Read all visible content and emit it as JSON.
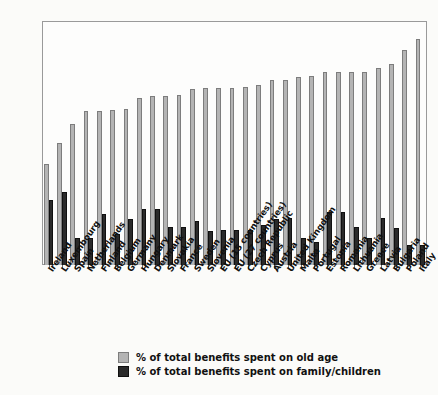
{
  "chart_data": {
    "type": "bar",
    "title": "",
    "subtitle": "",
    "xlabel": "",
    "ylabel": "",
    "ylim": [
      0,
      55
    ],
    "yticks": [
      0,
      5,
      10,
      15,
      20,
      25,
      30,
      35,
      40,
      45,
      50,
      55
    ],
    "grid": false,
    "legend_position": "bottom",
    "categories": [
      "Ireland",
      "Luxembourg",
      "Spain",
      "Netherlands",
      "Finland",
      "Belgium",
      "Germany",
      "Hungary",
      "Denmark",
      "Slovakia",
      "France",
      "Sweden",
      "Slovenia",
      "EU (15 countries)",
      "EU (27 countries)",
      "Czech Republic",
      "Cyprus",
      "Austria",
      "United Kingdom",
      "Malta",
      "Portugal",
      "Estonia",
      "Romania",
      "Lithuania",
      "Greece",
      "Latvia",
      "Bulgaria",
      "Poland",
      "Italy"
    ],
    "series": [
      {
        "name": "% of total benefits spent on old age",
        "color": "#b4b4b4",
        "values": [
          22.8,
          27.4,
          31.8,
          34.8,
          34.8,
          35.0,
          35.2,
          37.6,
          38.1,
          38.2,
          38.4,
          39.7,
          39.9,
          40.0,
          40.0,
          40.2,
          40.6,
          41.7,
          41.8,
          42.4,
          42.6,
          43.4,
          43.5,
          43.5,
          43.5,
          44.3,
          45.2,
          48.4,
          51.0
        ]
      },
      {
        "name": "% of total benefits spent on family/children",
        "color": "#2a2a2a",
        "values": [
          14.7,
          16.5,
          6.0,
          6.0,
          11.6,
          7.1,
          10.4,
          12.6,
          12.6,
          8.6,
          8.5,
          9.9,
          7.7,
          8.0,
          8.0,
          8.0,
          9.0,
          10.4,
          10.6,
          6.2,
          5.3,
          12.0,
          12.0,
          8.6,
          6.1,
          10.5,
          8.4,
          4.5,
          4.5
        ]
      }
    ],
    "legend": [
      {
        "label": "% of total benefits spent on old age",
        "swatch": "old"
      },
      {
        "label": "% of total benefits spent on family/children",
        "swatch": "fam"
      }
    ]
  }
}
